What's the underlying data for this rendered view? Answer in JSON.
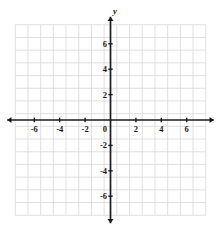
{
  "chart_data": {
    "type": "scatter",
    "title": "",
    "subtitle": "",
    "xlabel": "x",
    "ylabel": "y",
    "xlim": [
      -7.5,
      7.5
    ],
    "ylim": [
      -7.5,
      7.5
    ],
    "x_ticks": [
      -6,
      -4,
      -2,
      2,
      4,
      6
    ],
    "y_ticks": [
      -6,
      -4,
      -2,
      2,
      4,
      6
    ],
    "x_tick_labels": [
      "-6",
      "-4",
      "-2",
      "2",
      "4",
      "6"
    ],
    "y_tick_labels": [
      "-6",
      "-4",
      "-2",
      "2",
      "4",
      "6"
    ],
    "origin_label": "0",
    "tick_step": 2,
    "grid_step": 1,
    "grid": true,
    "grid_color": "#d8d8d8",
    "axis_color": "#1a1a1a",
    "legend": null,
    "legend_position": "none",
    "series": [],
    "annotations": [],
    "arrowheads": [
      "x-positive",
      "x-negative",
      "y-positive",
      "y-negative"
    ]
  },
  "plot": {
    "x_axis_label": "x",
    "y_axis_label": "y",
    "origin_text": "0",
    "x_labels": [
      {
        "value": -6,
        "text": "-6"
      },
      {
        "value": -4,
        "text": "-4"
      },
      {
        "value": -2,
        "text": "-2"
      },
      {
        "value": 2,
        "text": "2"
      },
      {
        "value": 4,
        "text": "4"
      },
      {
        "value": 6,
        "text": "6"
      }
    ],
    "y_labels": [
      {
        "value": 6,
        "text": "6"
      },
      {
        "value": 4,
        "text": "4"
      },
      {
        "value": 2,
        "text": "2"
      },
      {
        "value": -2,
        "text": "-2"
      },
      {
        "value": -4,
        "text": "-4"
      },
      {
        "value": -6,
        "text": "-6"
      }
    ],
    "colors": {
      "grid": "#d8d8d8",
      "axis": "#1a1a1a",
      "background": "#ffffff",
      "text": "#1a1a1a"
    }
  }
}
